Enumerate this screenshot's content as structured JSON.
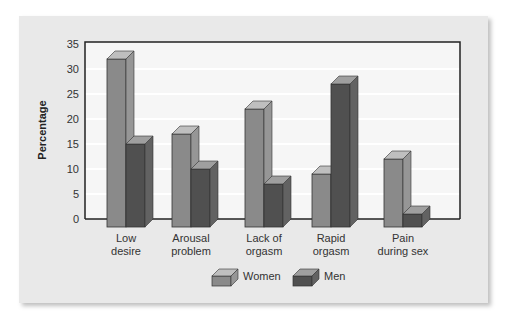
{
  "chart_data": {
    "type": "bar",
    "title": "",
    "xlabel": "",
    "ylabel": "Percentage",
    "ylim": [
      0,
      35
    ],
    "yticks": [
      0,
      5,
      10,
      15,
      20,
      25,
      30,
      35
    ],
    "grid": true,
    "legend_position": "bottom",
    "categories": [
      "Low desire",
      "Arousal problem",
      "Lack of orgasm",
      "Rapid orgasm",
      "Pain during sex"
    ],
    "category_lines": [
      [
        "Low",
        "desire"
      ],
      [
        "Arousal",
        "problem"
      ],
      [
        "Lack of",
        "orgasm"
      ],
      [
        "Rapid",
        "orgasm"
      ],
      [
        "Pain",
        "during sex"
      ]
    ],
    "series": [
      {
        "name": "Women",
        "values": [
          32,
          17,
          22,
          9,
          12
        ],
        "color": "#8a8a8a"
      },
      {
        "name": "Men",
        "values": [
          15,
          10,
          7,
          27,
          1
        ],
        "color": "#505050"
      }
    ]
  },
  "colors": {
    "panel": "#e9e9e9",
    "plot_bg": "#f6f6f6",
    "gridline": "#ffffff",
    "frame": "#222222"
  }
}
